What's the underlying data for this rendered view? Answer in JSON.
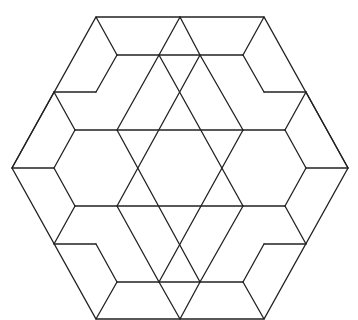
{
  "figure": {
    "stroke_color": "#222222",
    "background": "#ffffff",
    "outer_hexagon": [
      [
        96,
        17
      ],
      [
        264,
        17
      ],
      [
        348,
        168
      ],
      [
        264,
        319
      ],
      [
        96,
        319
      ],
      [
        12,
        168
      ]
    ],
    "lines": [
      [
        96,
        17,
        117,
        55
      ],
      [
        264,
        17,
        243,
        55
      ],
      [
        117,
        55,
        243,
        55
      ],
      [
        180,
        17,
        159,
        55
      ],
      [
        180,
        17,
        200,
        55
      ],
      [
        159,
        55,
        117,
        130
      ],
      [
        200,
        55,
        243,
        130
      ],
      [
        54,
        92,
        96,
        92
      ],
      [
        54,
        92,
        75,
        130
      ],
      [
        96,
        92,
        117,
        55
      ],
      [
        75,
        130,
        285,
        130
      ],
      [
        264,
        92,
        306,
        92
      ],
      [
        306,
        92,
        285,
        130
      ],
      [
        264,
        92,
        243,
        55
      ],
      [
        12,
        168,
        54,
        168
      ],
      [
        54,
        168,
        75,
        130
      ],
      [
        54,
        168,
        75,
        206
      ],
      [
        306,
        168,
        348,
        168
      ],
      [
        306,
        168,
        285,
        130
      ],
      [
        306,
        168,
        285,
        206
      ],
      [
        75,
        206,
        285,
        206
      ],
      [
        54,
        244,
        96,
        244
      ],
      [
        54,
        244,
        75,
        206
      ],
      [
        96,
        244,
        117,
        282
      ],
      [
        264,
        244,
        306,
        244
      ],
      [
        306,
        244,
        285,
        206
      ],
      [
        264,
        244,
        243,
        282
      ],
      [
        117,
        282,
        243,
        282
      ],
      [
        96,
        319,
        117,
        282
      ],
      [
        264,
        319,
        243,
        282
      ],
      [
        180,
        319,
        159,
        282
      ],
      [
        180,
        319,
        200,
        282
      ],
      [
        159,
        282,
        117,
        206
      ],
      [
        200,
        282,
        243,
        206
      ],
      [
        117,
        130,
        200,
        282
      ],
      [
        243,
        130,
        159,
        282
      ],
      [
        159,
        55,
        243,
        206
      ],
      [
        200,
        55,
        117,
        206
      ],
      [
        54,
        92,
        12,
        168
      ],
      [
        306,
        92,
        348,
        168
      ]
    ]
  }
}
